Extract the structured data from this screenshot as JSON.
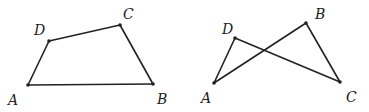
{
  "figures": [
    {
      "name": "quadrilateral-ABCD",
      "points": {
        "A": {
          "x": 28,
          "y": 85,
          "label": "A",
          "lx": 8,
          "ly": 105
        },
        "B": {
          "x": 153,
          "y": 84,
          "label": "B",
          "lx": 157,
          "ly": 104
        },
        "C": {
          "x": 120,
          "y": 25,
          "label": "C",
          "lx": 123,
          "ly": 19
        },
        "D": {
          "x": 49,
          "y": 41,
          "label": "D",
          "lx": 34,
          "ly": 35
        }
      },
      "edges": [
        [
          "A",
          "B"
        ],
        [
          "B",
          "C"
        ],
        [
          "C",
          "D"
        ],
        [
          "D",
          "A"
        ]
      ]
    },
    {
      "name": "crossed-quadrilateral-ABCD",
      "points": {
        "A": {
          "x": 214,
          "y": 83,
          "label": "A",
          "lx": 201,
          "ly": 103
        },
        "B": {
          "x": 306,
          "y": 23,
          "label": "B",
          "lx": 315,
          "ly": 19
        },
        "C": {
          "x": 340,
          "y": 82,
          "label": "C",
          "lx": 346,
          "ly": 102
        },
        "D": {
          "x": 235,
          "y": 38,
          "label": "D",
          "lx": 222,
          "ly": 34
        }
      },
      "edges": [
        [
          "A",
          "D"
        ],
        [
          "D",
          "C"
        ],
        [
          "C",
          "B"
        ],
        [
          "B",
          "A"
        ]
      ]
    }
  ]
}
